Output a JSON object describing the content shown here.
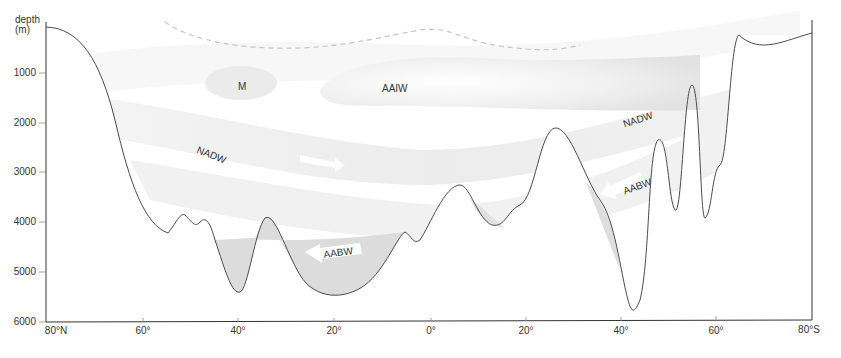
{
  "axis": {
    "y_title_line1": "depth",
    "y_title_line2": "(m)",
    "y_ticks": [
      {
        "label": "1000",
        "y": 73
      },
      {
        "label": "2000",
        "y": 123
      },
      {
        "label": "3000",
        "y": 172
      },
      {
        "label": "4000",
        "y": 222
      },
      {
        "label": "5000",
        "y": 272
      },
      {
        "label": "6000",
        "y": 322
      }
    ],
    "x_ticks": [
      {
        "label": "80°N",
        "x": 58
      },
      {
        "label": "60°",
        "x": 143
      },
      {
        "label": "40°",
        "x": 238
      },
      {
        "label": "20°",
        "x": 334
      },
      {
        "label": "0°",
        "x": 431
      },
      {
        "label": "20°",
        "x": 526
      },
      {
        "label": "40°",
        "x": 621
      },
      {
        "label": "60°",
        "x": 716
      },
      {
        "label": "80°S",
        "x": 812
      }
    ]
  },
  "water_masses": {
    "m": "M",
    "aaiw": "AAIW",
    "nadw_north": "NADW",
    "nadw_south": "NADW",
    "aabw_central": "AABW",
    "aabw_south": "AABW"
  },
  "colors": {
    "seafloor_line": "#4a4a4a",
    "aabw_fill": "#dcdcdc",
    "water_band": "#ececec",
    "dashed_line": "#c4c4c4",
    "axis": "#333333"
  }
}
